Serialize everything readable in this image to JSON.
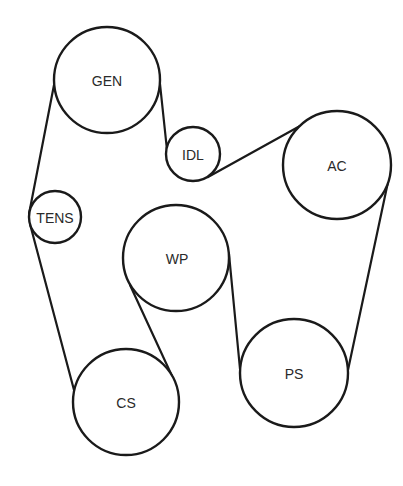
{
  "diagram": {
    "type": "serpentine-belt-routing",
    "colors": {
      "stroke": "#1a1a1a",
      "text": "#2a2a2a",
      "background": "#ffffff"
    },
    "pulleys": [
      {
        "id": "gen",
        "label": "GEN",
        "cx": 107,
        "cy": 80,
        "r": 53
      },
      {
        "id": "idl",
        "label": "IDL",
        "cx": 193,
        "cy": 154,
        "r": 27
      },
      {
        "id": "ac",
        "label": "AC",
        "cx": 337,
        "cy": 165,
        "r": 54
      },
      {
        "id": "tens",
        "label": "TENS",
        "cx": 55,
        "cy": 217,
        "r": 26
      },
      {
        "id": "wp",
        "label": "WP",
        "cx": 176,
        "cy": 258,
        "r": 53
      },
      {
        "id": "ps",
        "label": "PS",
        "cx": 294,
        "cy": 373,
        "r": 54
      },
      {
        "id": "cs",
        "label": "CS",
        "cx": 126,
        "cy": 402,
        "r": 53
      }
    ],
    "belt_route": [
      "GEN",
      "TENS",
      "CS",
      "WP",
      "PS",
      "AC",
      "IDL",
      "GEN"
    ]
  }
}
